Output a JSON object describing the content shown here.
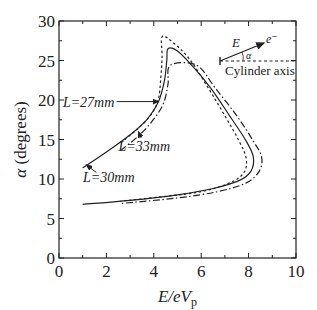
{
  "chart_data": {
    "type": "line",
    "title": "",
    "xlabel": "E/eV_p",
    "xlabel_parts": {
      "main": "E/eV",
      "sub": "p"
    },
    "ylabel": "α (degrees)",
    "ylabel_parts": {
      "symbol": "α",
      "text": "(degrees)"
    },
    "xlim": [
      0,
      10
    ],
    "ylim": [
      0,
      30
    ],
    "xticks": [
      "0",
      "2",
      "4",
      "6",
      "8",
      "10"
    ],
    "yticks": [
      "0",
      "5",
      "10",
      "15",
      "20",
      "25",
      "30"
    ],
    "grid": false,
    "legend": "none (inline annotations)",
    "series": [
      {
        "name": "L=30mm",
        "style": "solid",
        "points": [
          [
            1.0,
            11.4
          ],
          [
            2.0,
            13.4
          ],
          [
            3.0,
            15.6
          ],
          [
            3.7,
            17.5
          ],
          [
            4.2,
            19.8
          ],
          [
            4.45,
            22.5
          ],
          [
            4.55,
            25.0
          ],
          [
            4.6,
            26.5
          ],
          [
            5.0,
            26.2
          ],
          [
            5.6,
            24.4
          ],
          [
            6.4,
            21.5
          ],
          [
            7.2,
            18.0
          ],
          [
            7.9,
            14.8
          ],
          [
            8.2,
            12.8
          ],
          [
            8.1,
            11.0
          ],
          [
            7.6,
            9.8
          ],
          [
            6.5,
            8.8
          ],
          [
            5.0,
            8.0
          ],
          [
            3.0,
            7.3
          ],
          [
            1.0,
            6.8
          ]
        ]
      },
      {
        "name": "L=27mm",
        "style": "dotted",
        "points": [
          [
            2.6,
            14.6
          ],
          [
            3.3,
            16.3
          ],
          [
            3.9,
            18.2
          ],
          [
            4.2,
            20.2
          ],
          [
            4.3,
            23.0
          ],
          [
            4.35,
            25.5
          ],
          [
            4.35,
            28.0
          ],
          [
            4.8,
            27.3
          ],
          [
            5.5,
            25.2
          ],
          [
            6.2,
            22.0
          ],
          [
            7.0,
            18.0
          ],
          [
            7.6,
            14.8
          ],
          [
            7.9,
            12.6
          ],
          [
            7.8,
            10.8
          ],
          [
            7.2,
            9.5
          ],
          [
            6.0,
            8.4
          ],
          [
            4.5,
            7.8
          ],
          [
            2.6,
            7.2
          ]
        ]
      },
      {
        "name": "L=33mm",
        "style": "dashdot",
        "points": [
          [
            2.6,
            13.6
          ],
          [
            3.3,
            15.3
          ],
          [
            3.9,
            17.2
          ],
          [
            4.4,
            19.5
          ],
          [
            4.6,
            22.0
          ],
          [
            4.7,
            24.4
          ],
          [
            5.8,
            24.4
          ],
          [
            6.6,
            21.5
          ],
          [
            7.5,
            18.0
          ],
          [
            8.2,
            14.8
          ],
          [
            8.55,
            12.8
          ],
          [
            8.45,
            11.0
          ],
          [
            7.9,
            9.5
          ],
          [
            6.7,
            8.4
          ],
          [
            5.0,
            7.6
          ],
          [
            2.6,
            6.9
          ]
        ]
      }
    ],
    "annotations": [
      {
        "text": "L=27mm",
        "label_at": [
          1.25,
          19.8
        ],
        "arrow_to": [
          4.2,
          19.8
        ]
      },
      {
        "text": "L=33mm",
        "label_at": [
          3.6,
          14.2
        ],
        "arrow_to": [
          3.35,
          16.0
        ]
      },
      {
        "text": "L=30mm",
        "label_at": [
          2.1,
          10.2
        ],
        "arrow_to": [
          1.15,
          11.8
        ]
      }
    ],
    "inset": {
      "vector_label": "E",
      "particle_label": "e⁻",
      "angle_label": "α",
      "axis_label": "Cylinder axis"
    }
  }
}
